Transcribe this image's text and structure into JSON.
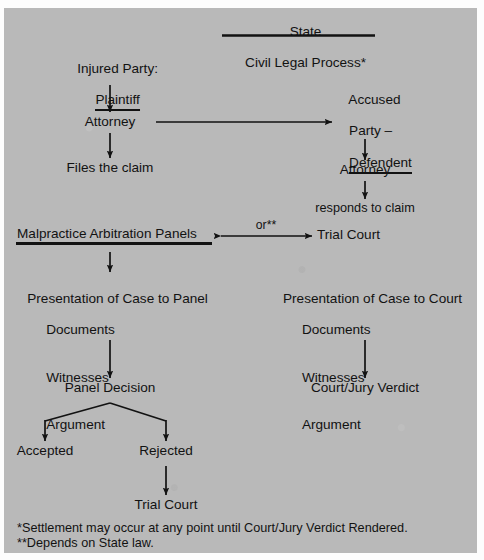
{
  "diagram": {
    "title_line1": "State",
    "title_line2": "Civil Legal Process*",
    "background_color": "#b9b9b9",
    "text_color": "#121212",
    "nodes": {
      "injured_party_label": "Injured Party:",
      "plaintiff": "Plaintiff",
      "attorney_left": "Attorney",
      "files_the_claim": "Files the claim",
      "accused_line1": "Accused",
      "accused_line2": "Party –",
      "defendant": "Defendent",
      "attorney_right": "Attorney",
      "responds_to_claim": "responds to claim",
      "malpractice_panels": "Malpractice Arbitration Panels",
      "or_label": "or**",
      "trial_court_mid": "Trial Court",
      "presentation_panel_title": "Presentation of Case to Panel",
      "presentation_court_title": "Presentation of Case to Court",
      "evidence_documents": "Documents",
      "evidence_witnesses": "Witnesses",
      "evidence_argument": "Argument",
      "panel_decision": "Panel Decision",
      "court_jury_verdict": "Court/Jury Verdict",
      "accepted": "Accepted",
      "rejected": "Rejected",
      "trial_court_bottom": "Trial Court"
    },
    "footnotes": {
      "one": "*Settlement may occur at any point until Court/Jury Verdict Rendered.",
      "two": "**Depends on State law."
    }
  }
}
